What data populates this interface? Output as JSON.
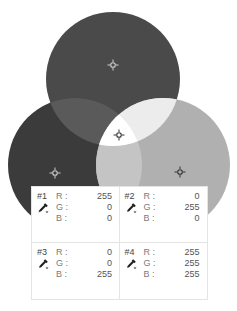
{
  "canvas": {
    "circles": [
      {
        "name": "red-circle",
        "cx": 113,
        "cy": 79,
        "r": 67,
        "color": "#4a4a4a"
      },
      {
        "name": "blue-circle",
        "cx": 75,
        "cy": 165,
        "r": 67,
        "color": "#3b3b3b"
      },
      {
        "name": "green-circle",
        "cx": 163,
        "cy": 165,
        "r": 67,
        "color": "#b0b0b0"
      }
    ],
    "overlap_colors": {
      "red_blue": "#5a5a5a",
      "red_green": "#ececec",
      "blue_green": "#c4c4c4",
      "all": "#ffffff"
    },
    "samplers": [
      {
        "id": "1",
        "x": 113,
        "y": 65
      },
      {
        "id": "2",
        "x": 119,
        "y": 135
      },
      {
        "id": "3",
        "x": 55,
        "y": 173
      },
      {
        "id": "4",
        "x": 180,
        "y": 172
      }
    ]
  },
  "info_panel": {
    "samples": [
      {
        "label": "#1",
        "r_label": "R :",
        "g_label": "G :",
        "b_label": "B :",
        "r": "255",
        "g": "0",
        "b": "0"
      },
      {
        "label": "#2",
        "r_label": "R :",
        "g_label": "G :",
        "b_label": "B :",
        "r": "0",
        "g": "255",
        "b": "0"
      },
      {
        "label": "#3",
        "r_label": "R :",
        "g_label": "G :",
        "b_label": "B :",
        "r": "0",
        "g": "0",
        "b": "255"
      },
      {
        "label": "#4",
        "r_label": "R :",
        "g_label": "G :",
        "b_label": "B :",
        "r": "255",
        "g": "255",
        "b": "255"
      }
    ]
  }
}
